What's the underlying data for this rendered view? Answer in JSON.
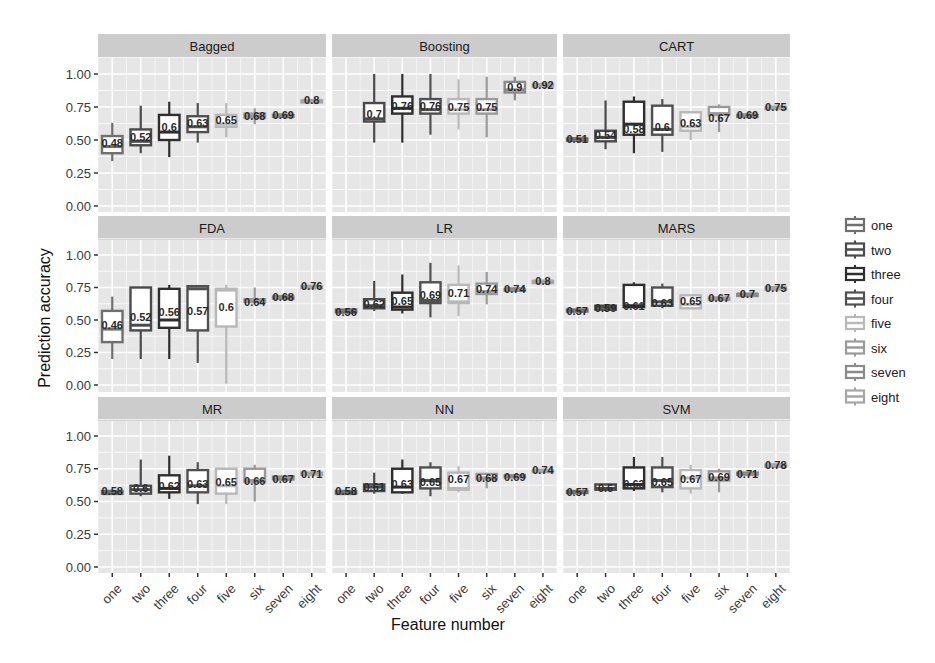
{
  "chart_data": {
    "type": "box",
    "layout": "facet_grid_3x3",
    "xlabel": "Feature number",
    "ylabel": "Prediction accuracy",
    "ylim": [
      0,
      1
    ],
    "y_ticks": [
      "0.00",
      "0.25",
      "0.50",
      "0.75",
      "1.00"
    ],
    "y_tick_values": [
      0,
      0.25,
      0.5,
      0.75,
      1.0
    ],
    "categories": [
      "one",
      "two",
      "three",
      "four",
      "five",
      "six",
      "seven",
      "eight"
    ],
    "grid": true,
    "legend_position": "right",
    "legend": [
      {
        "label": "one",
        "color": "#6f6f6f"
      },
      {
        "label": "two",
        "color": "#4a4a4a"
      },
      {
        "label": "three",
        "color": "#2e2e2e"
      },
      {
        "label": "four",
        "color": "#505050"
      },
      {
        "label": "five",
        "color": "#b8b8b8"
      },
      {
        "label": "six",
        "color": "#9a9a9a"
      },
      {
        "label": "seven",
        "color": "#8a8a8a"
      },
      {
        "label": "eight",
        "color": "#a6a6a6"
      }
    ],
    "panels": [
      {
        "title": "Bagged",
        "labels": [
          "0.48",
          "0.52",
          "0.6",
          "0.63",
          "0.65",
          "0.68",
          "0.69",
          "0.8"
        ],
        "boxes": [
          {
            "cat": "one",
            "lo": 0.34,
            "q1": 0.4,
            "med": 0.45,
            "q3": 0.53,
            "hi": 0.63
          },
          {
            "cat": "two",
            "lo": 0.4,
            "q1": 0.46,
            "med": 0.49,
            "q3": 0.58,
            "hi": 0.76
          },
          {
            "cat": "three",
            "lo": 0.37,
            "q1": 0.5,
            "med": 0.56,
            "q3": 0.69,
            "hi": 0.79
          },
          {
            "cat": "four",
            "lo": 0.48,
            "q1": 0.56,
            "med": 0.6,
            "q3": 0.68,
            "hi": 0.78
          },
          {
            "cat": "five",
            "lo": 0.52,
            "q1": 0.6,
            "med": 0.62,
            "q3": 0.69,
            "hi": 0.78
          },
          {
            "cat": "six",
            "lo": 0.62,
            "q1": 0.67,
            "med": 0.68,
            "q3": 0.7,
            "hi": 0.74
          },
          {
            "cat": "seven",
            "lo": 0.69,
            "q1": 0.69,
            "med": 0.69,
            "q3": 0.69,
            "hi": 0.69
          },
          {
            "cat": "eight",
            "lo": 0.8,
            "q1": 0.8,
            "med": 0.8,
            "q3": 0.8,
            "hi": 0.8
          }
        ]
      },
      {
        "title": "Boosting",
        "labels": [
          "",
          "0.7",
          "0.76",
          "0.76",
          "0.75",
          "0.75",
          "0.9",
          "0.92"
        ],
        "boxes": [
          {
            "cat": "two",
            "lo": 0.48,
            "q1": 0.64,
            "med": 0.66,
            "q3": 0.78,
            "hi": 1.0
          },
          {
            "cat": "three",
            "lo": 0.48,
            "q1": 0.7,
            "med": 0.74,
            "q3": 0.83,
            "hi": 1.0
          },
          {
            "cat": "four",
            "lo": 0.54,
            "q1": 0.7,
            "med": 0.73,
            "q3": 0.81,
            "hi": 1.0
          },
          {
            "cat": "five",
            "lo": 0.58,
            "q1": 0.7,
            "med": 0.73,
            "q3": 0.81,
            "hi": 0.96
          },
          {
            "cat": "six",
            "lo": 0.52,
            "q1": 0.7,
            "med": 0.73,
            "q3": 0.81,
            "hi": 0.98
          },
          {
            "cat": "seven",
            "lo": 0.8,
            "q1": 0.86,
            "med": 0.88,
            "q3": 0.94,
            "hi": 0.98
          },
          {
            "cat": "eight",
            "lo": 0.92,
            "q1": 0.92,
            "med": 0.92,
            "q3": 0.92,
            "hi": 0.92
          }
        ]
      },
      {
        "title": "CART",
        "labels": [
          "0.51",
          "0.54",
          "0.58",
          "0.6",
          "0.63",
          "0.67",
          "0.69",
          "0.75"
        ],
        "boxes": [
          {
            "cat": "one",
            "lo": 0.51,
            "q1": 0.51,
            "med": 0.51,
            "q3": 0.51,
            "hi": 0.51
          },
          {
            "cat": "two",
            "lo": 0.43,
            "q1": 0.49,
            "med": 0.52,
            "q3": 0.57,
            "hi": 0.8
          },
          {
            "cat": "three",
            "lo": 0.4,
            "q1": 0.54,
            "med": 0.62,
            "q3": 0.79,
            "hi": 0.83
          },
          {
            "cat": "four",
            "lo": 0.41,
            "q1": 0.54,
            "med": 0.58,
            "q3": 0.76,
            "hi": 0.81
          },
          {
            "cat": "five",
            "lo": 0.5,
            "q1": 0.57,
            "med": 0.6,
            "q3": 0.71,
            "hi": 0.71
          },
          {
            "cat": "six",
            "lo": 0.56,
            "q1": 0.69,
            "med": 0.7,
            "q3": 0.75,
            "hi": 0.77
          },
          {
            "cat": "seven",
            "lo": 0.69,
            "q1": 0.69,
            "med": 0.69,
            "q3": 0.69,
            "hi": 0.69
          },
          {
            "cat": "eight",
            "lo": 0.75,
            "q1": 0.75,
            "med": 0.75,
            "q3": 0.75,
            "hi": 0.75
          }
        ]
      },
      {
        "title": "FDA",
        "labels": [
          "0.46",
          "0.52",
          "0.56",
          "0.57",
          "0.6",
          "0.64",
          "0.68",
          "0.76"
        ],
        "boxes": [
          {
            "cat": "one",
            "lo": 0.2,
            "q1": 0.33,
            "med": 0.43,
            "q3": 0.57,
            "hi": 0.68
          },
          {
            "cat": "two",
            "lo": 0.2,
            "q1": 0.42,
            "med": 0.46,
            "q3": 0.75,
            "hi": 0.75
          },
          {
            "cat": "three",
            "lo": 0.2,
            "q1": 0.44,
            "med": 0.5,
            "q3": 0.74,
            "hi": 0.77
          },
          {
            "cat": "four",
            "lo": 0.17,
            "q1": 0.42,
            "med": 0.74,
            "q3": 0.76,
            "hi": 0.77
          },
          {
            "cat": "five",
            "lo": 0.01,
            "q1": 0.45,
            "med": 0.73,
            "q3": 0.74,
            "hi": 0.77
          },
          {
            "cat": "six",
            "lo": 0.64,
            "q1": 0.64,
            "med": 0.64,
            "q3": 0.66,
            "hi": 0.75
          },
          {
            "cat": "seven",
            "lo": 0.68,
            "q1": 0.68,
            "med": 0.68,
            "q3": 0.68,
            "hi": 0.68
          },
          {
            "cat": "eight",
            "lo": 0.76,
            "q1": 0.76,
            "med": 0.76,
            "q3": 0.76,
            "hi": 0.76
          }
        ]
      },
      {
        "title": "LR",
        "labels": [
          "0.56",
          "0.62",
          "0.65",
          "0.69",
          "0.71",
          "0.74",
          "0.74",
          "0.8"
        ],
        "boxes": [
          {
            "cat": "one",
            "lo": 0.56,
            "q1": 0.56,
            "med": 0.56,
            "q3": 0.58,
            "hi": 0.58
          },
          {
            "cat": "two",
            "lo": 0.57,
            "q1": 0.59,
            "med": 0.61,
            "q3": 0.66,
            "hi": 0.8
          },
          {
            "cat": "three",
            "lo": 0.55,
            "q1": 0.58,
            "med": 0.6,
            "q3": 0.71,
            "hi": 0.85
          },
          {
            "cat": "four",
            "lo": 0.52,
            "q1": 0.63,
            "med": 0.65,
            "q3": 0.79,
            "hi": 0.94
          },
          {
            "cat": "five",
            "lo": 0.53,
            "q1": 0.63,
            "med": 0.64,
            "q3": 0.77,
            "hi": 0.92
          },
          {
            "cat": "six",
            "lo": 0.62,
            "q1": 0.7,
            "med": 0.72,
            "q3": 0.78,
            "hi": 0.87
          },
          {
            "cat": "seven",
            "lo": 0.74,
            "q1": 0.74,
            "med": 0.74,
            "q3": 0.74,
            "hi": 0.74
          },
          {
            "cat": "eight",
            "lo": 0.8,
            "q1": 0.8,
            "med": 0.8,
            "q3": 0.8,
            "hi": 0.8
          }
        ]
      },
      {
        "title": "MARS",
        "labels": [
          "0.57",
          "0.59",
          "0.61",
          "0.63",
          "0.65",
          "0.67",
          "0.7",
          "0.75"
        ],
        "boxes": [
          {
            "cat": "one",
            "lo": 0.57,
            "q1": 0.57,
            "med": 0.57,
            "q3": 0.58,
            "hi": 0.58
          },
          {
            "cat": "two",
            "lo": 0.57,
            "q1": 0.58,
            "med": 0.6,
            "q3": 0.61,
            "hi": 0.62
          },
          {
            "cat": "three",
            "lo": 0.59,
            "q1": 0.6,
            "med": 0.61,
            "q3": 0.77,
            "hi": 0.79
          },
          {
            "cat": "four",
            "lo": 0.59,
            "q1": 0.61,
            "med": 0.64,
            "q3": 0.75,
            "hi": 0.78
          },
          {
            "cat": "five",
            "lo": 0.59,
            "q1": 0.59,
            "med": 0.62,
            "q3": 0.69,
            "hi": 0.69
          },
          {
            "cat": "six",
            "lo": 0.66,
            "q1": 0.67,
            "med": 0.67,
            "q3": 0.67,
            "hi": 0.67
          },
          {
            "cat": "seven",
            "lo": 0.7,
            "q1": 0.7,
            "med": 0.7,
            "q3": 0.7,
            "hi": 0.7
          },
          {
            "cat": "eight",
            "lo": 0.75,
            "q1": 0.75,
            "med": 0.75,
            "q3": 0.75,
            "hi": 0.75
          }
        ]
      },
      {
        "title": "MR",
        "labels": [
          "0.58",
          "0.6",
          "0.62",
          "0.63",
          "0.65",
          "0.66",
          "0.67",
          "0.71"
        ],
        "boxes": [
          {
            "cat": "one",
            "lo": 0.56,
            "q1": 0.56,
            "med": 0.56,
            "q3": 0.58,
            "hi": 0.58
          },
          {
            "cat": "two",
            "lo": 0.54,
            "q1": 0.56,
            "med": 0.59,
            "q3": 0.62,
            "hi": 0.82
          },
          {
            "cat": "three",
            "lo": 0.52,
            "q1": 0.57,
            "med": 0.6,
            "q3": 0.7,
            "hi": 0.85
          },
          {
            "cat": "four",
            "lo": 0.48,
            "q1": 0.57,
            "med": 0.62,
            "q3": 0.74,
            "hi": 0.8
          },
          {
            "cat": "five",
            "lo": 0.48,
            "q1": 0.56,
            "med": 0.62,
            "q3": 0.75,
            "hi": 0.75
          },
          {
            "cat": "six",
            "lo": 0.5,
            "q1": 0.65,
            "med": 0.66,
            "q3": 0.75,
            "hi": 0.78
          },
          {
            "cat": "seven",
            "lo": 0.67,
            "q1": 0.67,
            "med": 0.67,
            "q3": 0.69,
            "hi": 0.69
          },
          {
            "cat": "eight",
            "lo": 0.71,
            "q1": 0.71,
            "med": 0.71,
            "q3": 0.72,
            "hi": 0.72
          }
        ]
      },
      {
        "title": "NN",
        "labels": [
          "0.58",
          "0.61",
          "0.63",
          "0.65",
          "0.67",
          "0.68",
          "0.69",
          "0.74"
        ],
        "boxes": [
          {
            "cat": "one",
            "lo": 0.56,
            "q1": 0.56,
            "med": 0.56,
            "q3": 0.58,
            "hi": 0.58
          },
          {
            "cat": "two",
            "lo": 0.56,
            "q1": 0.58,
            "med": 0.61,
            "q3": 0.63,
            "hi": 0.72
          },
          {
            "cat": "three",
            "lo": 0.56,
            "q1": 0.57,
            "med": 0.61,
            "q3": 0.75,
            "hi": 0.82
          },
          {
            "cat": "four",
            "lo": 0.54,
            "q1": 0.6,
            "med": 0.66,
            "q3": 0.76,
            "hi": 0.8
          },
          {
            "cat": "five",
            "lo": 0.57,
            "q1": 0.59,
            "med": 0.6,
            "q3": 0.72,
            "hi": 0.77
          },
          {
            "cat": "six",
            "lo": 0.6,
            "q1": 0.67,
            "med": 0.68,
            "q3": 0.71,
            "hi": 0.72
          },
          {
            "cat": "seven",
            "lo": 0.69,
            "q1": 0.69,
            "med": 0.69,
            "q3": 0.7,
            "hi": 0.7
          },
          {
            "cat": "eight",
            "lo": 0.74,
            "q1": 0.74,
            "med": 0.74,
            "q3": 0.74,
            "hi": 0.74
          }
        ]
      },
      {
        "title": "SVM",
        "labels": [
          "0.57",
          "0.6",
          "0.63",
          "0.65",
          "0.67",
          "0.69",
          "0.71",
          "0.78"
        ],
        "boxes": [
          {
            "cat": "one",
            "lo": 0.57,
            "q1": 0.57,
            "med": 0.57,
            "q3": 0.58,
            "hi": 0.58
          },
          {
            "cat": "two",
            "lo": 0.58,
            "q1": 0.59,
            "med": 0.6,
            "q3": 0.63,
            "hi": 0.63
          },
          {
            "cat": "three",
            "lo": 0.58,
            "q1": 0.6,
            "med": 0.63,
            "q3": 0.76,
            "hi": 0.84
          },
          {
            "cat": "four",
            "lo": 0.57,
            "q1": 0.61,
            "med": 0.66,
            "q3": 0.76,
            "hi": 0.84
          },
          {
            "cat": "five",
            "lo": 0.56,
            "q1": 0.6,
            "med": 0.68,
            "q3": 0.74,
            "hi": 0.78
          },
          {
            "cat": "six",
            "lo": 0.57,
            "q1": 0.66,
            "med": 0.68,
            "q3": 0.73,
            "hi": 0.75
          },
          {
            "cat": "seven",
            "lo": 0.71,
            "q1": 0.71,
            "med": 0.71,
            "q3": 0.72,
            "hi": 0.72
          },
          {
            "cat": "eight",
            "lo": 0.78,
            "q1": 0.78,
            "med": 0.78,
            "q3": 0.78,
            "hi": 0.78
          }
        ]
      }
    ]
  },
  "colors": {
    "panel_bg": "#e6e6e6",
    "strip_bg": "#cccccc",
    "grid": "#ffffff",
    "box_fill": "#ffffff"
  }
}
